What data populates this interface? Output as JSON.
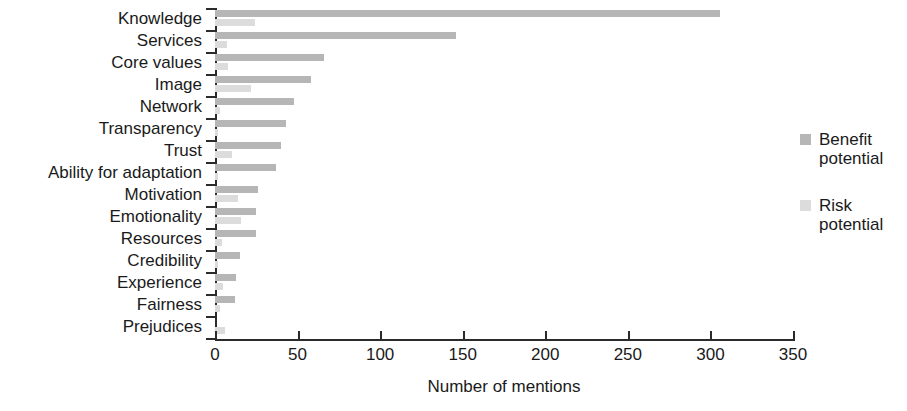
{
  "chart_data": {
    "type": "bar",
    "orientation": "horizontal",
    "title": "",
    "xlabel": "Number of mentions",
    "ylabel": "",
    "xlim": [
      0,
      350
    ],
    "xticks": [
      0,
      50,
      100,
      150,
      200,
      250,
      300,
      350
    ],
    "grid": false,
    "legend_position": "right",
    "categories": [
      "Knowledge",
      "Services",
      "Core values",
      "Image",
      "Network",
      "Transparency",
      "Trust",
      "Ability for adaptation",
      "Motivation",
      "Emotionality",
      "Resources",
      "Credibility",
      "Experience",
      "Fairness",
      "Prejudices"
    ],
    "series": [
      {
        "name": "Benefit potential",
        "color": "#b6b6b6",
        "values": [
          306,
          146,
          66,
          58,
          48,
          43,
          40,
          37,
          26,
          25,
          25,
          15,
          13,
          12,
          0
        ]
      },
      {
        "name": "Risk potential",
        "color": "#dcdcdc",
        "values": [
          24,
          7,
          8,
          22,
          3,
          2,
          10,
          2,
          14,
          16,
          4,
          2,
          5,
          3,
          6
        ]
      }
    ]
  },
  "legend": {
    "items": [
      {
        "label_line1": "Benefit",
        "label_line2": "potential",
        "color": "#b6b6b6"
      },
      {
        "label_line1": "Risk",
        "label_line2": "potential",
        "color": "#dcdcdc"
      }
    ]
  },
  "axis": {
    "x_title": "Number of mentions",
    "x_tick_labels": [
      "0",
      "50",
      "100",
      "150",
      "200",
      "250",
      "300",
      "350"
    ]
  }
}
